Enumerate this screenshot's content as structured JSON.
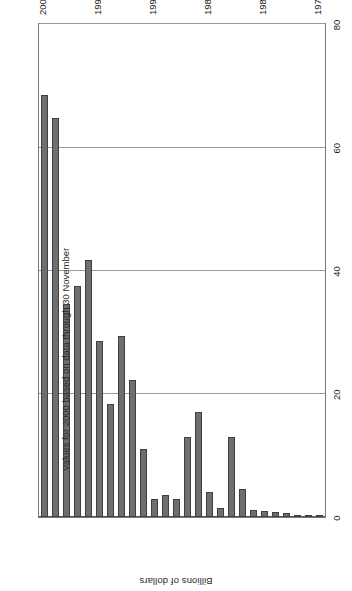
{
  "chart_data": {
    "type": "bar",
    "orientation": "horizontal",
    "title": "",
    "subtitle": "",
    "annotation": "Values for 2000 based on data through 30 November",
    "xlabel": "",
    "ylabel": "Billions of dollars",
    "value_axis_label": "Billions of dollars",
    "categories": [
      "1975",
      "1976",
      "1977",
      "1978",
      "1979",
      "1980",
      "1981",
      "1982",
      "1983",
      "1984",
      "1985",
      "1986",
      "1987",
      "1988",
      "1989",
      "1990",
      "1991",
      "1992",
      "1993",
      "1994",
      "1995",
      "1996",
      "1997",
      "1998",
      "1999",
      "2000"
    ],
    "values": [
      0.3,
      0.3,
      0.4,
      0.6,
      0.8,
      1.0,
      1.2,
      4.5,
      13.0,
      1.5,
      4.0,
      17.0,
      13.0,
      3.0,
      3.5,
      3.0,
      11.0,
      22.3,
      29.3,
      18.3,
      28.5,
      41.7,
      37.5,
      34.5,
      64.8,
      68.5
    ],
    "value_ticks": [
      "0",
      "20",
      "40",
      "60",
      "80"
    ],
    "value_tick_values": [
      0,
      20,
      40,
      60,
      80
    ],
    "category_ticks": [
      "1975",
      "1980",
      "1985",
      "1990",
      "1995",
      "2000"
    ],
    "category_tick_values": [
      1975,
      1980,
      1985,
      1990,
      1995,
      2000
    ],
    "xlim": [
      0,
      80
    ],
    "ylim": [
      1975,
      2000
    ],
    "grid": true,
    "grid_axis": "value",
    "legend": false,
    "legend_position": "none",
    "bar_color": "#6e6e6e",
    "bar_edge_color": "#3f3f3f",
    "grid_color": "#9a9a9a",
    "frame_color": "#777777",
    "background_color": "#ffffff"
  }
}
